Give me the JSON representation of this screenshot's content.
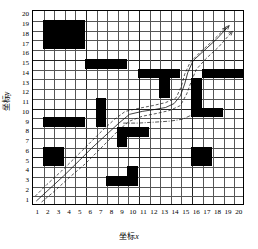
{
  "axes": {
    "x_title": "坐标x",
    "y_title": "坐标y",
    "x_ticks": [
      "1",
      "2",
      "3",
      "4",
      "5",
      "6",
      "7",
      "8",
      "9",
      "10",
      "11",
      "12",
      "13",
      "14",
      "15",
      "16",
      "17",
      "18",
      "19",
      "20"
    ],
    "y_ticks": [
      "1",
      "2",
      "3",
      "4",
      "5",
      "6",
      "7",
      "8",
      "9",
      "10",
      "11",
      "12",
      "13",
      "14",
      "15",
      "16",
      "17",
      "18",
      "19",
      "20"
    ],
    "x_range": [
      1,
      20
    ],
    "y_range": [
      1,
      20
    ],
    "grid": true
  },
  "chart_data": {
    "type": "heatmap",
    "title": "",
    "xlabel": "坐标x",
    "ylabel": "坐标y",
    "xlim": [
      1,
      21
    ],
    "ylim": [
      1,
      21
    ],
    "grid_size": [
      20,
      20
    ],
    "obstacles": [
      {
        "x": 2,
        "y": 17,
        "w": 4,
        "h": 3
      },
      {
        "x": 6,
        "y": 15,
        "w": 4,
        "h": 1
      },
      {
        "x": 11,
        "y": 14,
        "w": 3,
        "h": 1
      },
      {
        "x": 14,
        "y": 14,
        "w": 1,
        "h": 1
      },
      {
        "x": 17,
        "y": 14,
        "w": 4,
        "h": 1
      },
      {
        "x": 13,
        "y": 12,
        "w": 1,
        "h": 2
      },
      {
        "x": 16,
        "y": 11,
        "w": 1,
        "h": 3
      },
      {
        "x": 16,
        "y": 10,
        "w": 3,
        "h": 1
      },
      {
        "x": 7,
        "y": 10,
        "w": 1,
        "h": 2
      },
      {
        "x": 2,
        "y": 9,
        "w": 4,
        "h": 1
      },
      {
        "x": 7,
        "y": 9,
        "w": 1,
        "h": 1
      },
      {
        "x": 10,
        "y": 8,
        "w": 2,
        "h": 1
      },
      {
        "x": 9,
        "y": 7,
        "w": 1,
        "h": 2
      },
      {
        "x": 2,
        "y": 5,
        "w": 2,
        "h": 2
      },
      {
        "x": 16,
        "y": 5,
        "w": 2,
        "h": 2
      },
      {
        "x": 10,
        "y": 4,
        "w": 1,
        "h": 1
      },
      {
        "x": 8,
        "y": 3,
        "w": 3,
        "h": 1
      }
    ],
    "paths": [
      {
        "name": "path-solid",
        "style": "solid",
        "points": [
          [
            1.4,
            1.4
          ],
          [
            2.6,
            2.6
          ],
          [
            4.0,
            4.0
          ],
          [
            5.5,
            5.6
          ],
          [
            6.6,
            6.8
          ],
          [
            7.4,
            7.6
          ],
          [
            8.2,
            8.4
          ],
          [
            9.2,
            9.4
          ],
          [
            10.2,
            10.3
          ],
          [
            11.4,
            10.6
          ],
          [
            12.6,
            10.8
          ],
          [
            13.6,
            11.0
          ],
          [
            14.4,
            11.4
          ],
          [
            15.0,
            12.2
          ],
          [
            15.4,
            13.4
          ],
          [
            15.7,
            14.6
          ],
          [
            16.2,
            15.8
          ],
          [
            17.2,
            16.8
          ],
          [
            18.4,
            18.0
          ],
          [
            19.6,
            19.4
          ]
        ]
      },
      {
        "name": "path-dashed-upper",
        "style": "dashed",
        "points": [
          [
            1.3,
            1.9
          ],
          [
            2.4,
            3.1
          ],
          [
            3.8,
            4.5
          ],
          [
            5.2,
            6.0
          ],
          [
            6.4,
            7.3
          ],
          [
            7.6,
            8.6
          ],
          [
            8.8,
            9.8
          ],
          [
            9.8,
            10.6
          ],
          [
            11.0,
            10.9
          ],
          [
            12.4,
            11.2
          ],
          [
            13.6,
            11.5
          ],
          [
            14.6,
            12.0
          ],
          [
            15.1,
            13.2
          ],
          [
            15.4,
            14.4
          ],
          [
            15.9,
            15.6
          ],
          [
            16.8,
            16.6
          ],
          [
            18.0,
            17.8
          ],
          [
            19.3,
            19.2
          ]
        ]
      },
      {
        "name": "path-dashed-lower",
        "style": "dashed",
        "points": [
          [
            1.9,
            1.3
          ],
          [
            3.1,
            2.4
          ],
          [
            4.5,
            3.8
          ],
          [
            6.0,
            5.2
          ],
          [
            7.2,
            6.5
          ],
          [
            8.2,
            7.6
          ],
          [
            9.2,
            8.7
          ],
          [
            10.2,
            9.6
          ],
          [
            11.4,
            10.1
          ],
          [
            12.8,
            10.4
          ],
          [
            14.0,
            10.7
          ],
          [
            15.0,
            11.2
          ],
          [
            15.6,
            12.4
          ],
          [
            16.0,
            13.6
          ],
          [
            16.5,
            14.9
          ],
          [
            17.4,
            16.0
          ],
          [
            18.6,
            17.2
          ],
          [
            19.9,
            18.8
          ]
        ]
      },
      {
        "name": "path-dashdot",
        "style": "dashdot",
        "points": [
          [
            9.6,
            9.4
          ],
          [
            11.0,
            9.4
          ],
          [
            12.6,
            9.5
          ],
          [
            14.0,
            9.6
          ],
          [
            15.2,
            9.8
          ],
          [
            16.0,
            10.2
          ]
        ]
      }
    ]
  }
}
